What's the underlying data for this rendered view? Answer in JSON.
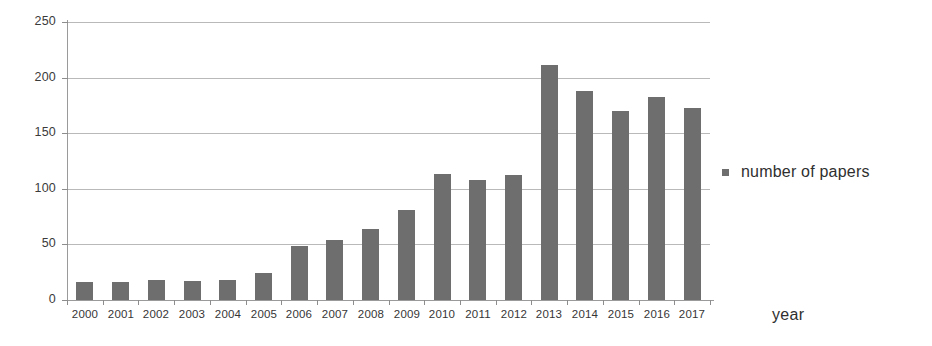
{
  "chart_data": {
    "type": "bar",
    "title": "",
    "xlabel": "year",
    "ylabel": "",
    "categories": [
      "2000",
      "2001",
      "2002",
      "2003",
      "2004",
      "2005",
      "2006",
      "2007",
      "2008",
      "2009",
      "2010",
      "2011",
      "2012",
      "2013",
      "2014",
      "2015",
      "2016",
      "2017"
    ],
    "series": [
      {
        "name": "number of papers",
        "color": "#6e6e6e",
        "values": [
          16,
          16,
          18,
          17,
          18,
          24,
          49,
          54,
          64,
          81,
          113,
          108,
          112,
          211,
          188,
          170,
          183,
          173
        ]
      }
    ],
    "ylim": [
      0,
      250
    ],
    "yticks": [
      0,
      50,
      100,
      150,
      200,
      250
    ],
    "ytick_labels": [
      "0",
      "50",
      "100",
      "150",
      "200",
      "250"
    ],
    "grid": true,
    "grid_axis": "y",
    "legend": {
      "position": "right",
      "entries": [
        {
          "label": "number of papers",
          "marker": "square",
          "color": "#6e6e6e"
        }
      ]
    }
  }
}
